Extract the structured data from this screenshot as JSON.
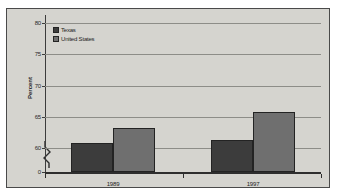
{
  "chart_data": {
    "type": "bar",
    "title": "",
    "xlabel": "",
    "ylabel": "Percent",
    "categories": [
      "1989",
      "1997"
    ],
    "series": [
      {
        "name": "Texas",
        "color": "#3c3c3c",
        "values": [
          60.8,
          61.3
        ]
      },
      {
        "name": "United States",
        "color": "#6f6f6f",
        "values": [
          63.2,
          65.7
        ]
      }
    ],
    "ylim": [
      0,
      80
    ],
    "yticks": [
      "0",
      "60",
      "65",
      "70",
      "75",
      "80"
    ],
    "ytick_values": [
      0,
      60,
      65,
      70,
      75,
      80
    ],
    "grid": true,
    "axis_break": true,
    "legend_position": "top-left",
    "plot_background": "#d5d4cf",
    "gridline_color": "#8d8d88"
  },
  "legend": {
    "items": [
      {
        "label": "Texas"
      },
      {
        "label": "United States"
      }
    ]
  },
  "axis": {
    "y_title": "Percent",
    "ticks": [
      {
        "label": "80",
        "value": 80
      },
      {
        "label": "75",
        "value": 75
      },
      {
        "label": "70",
        "value": 70
      },
      {
        "label": "65",
        "value": 65
      },
      {
        "label": "60",
        "value": 60
      },
      {
        "label": "0",
        "value": 0
      }
    ],
    "x_categories": [
      {
        "label": "1989"
      },
      {
        "label": "1997"
      }
    ]
  }
}
